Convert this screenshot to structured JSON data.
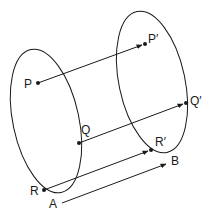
{
  "diagram": {
    "colors": {
      "stroke": "#1a1a1a",
      "background": "#ffffff"
    },
    "labels": {
      "P": "P",
      "Q": "Q",
      "R": "R",
      "P_prime": "P′",
      "Q_prime": "Q′",
      "R_prime": "R′",
      "A": "A",
      "B": "B"
    },
    "points": {
      "P": [
        38,
        83
      ],
      "Q": [
        79,
        143
      ],
      "R": [
        44,
        190
      ],
      "P_prime": [
        145,
        44
      ],
      "Q_prime": [
        186,
        103
      ],
      "R_prime": [
        151,
        150
      ],
      "A": [
        62,
        203
      ],
      "B": [
        166,
        164
      ]
    },
    "arrows": [
      {
        "from": "P",
        "to": "P_prime"
      },
      {
        "from": "Q",
        "to": "Q_prime"
      },
      {
        "from": "R",
        "to": "R_prime"
      },
      {
        "from": "A",
        "to": "B"
      }
    ]
  }
}
